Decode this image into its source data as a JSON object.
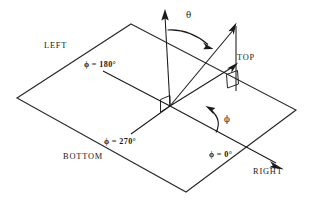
{
  "figure": {
    "type": "spherical-coordinate-diagram",
    "background_color": "#ffffff",
    "line_color": "#1a1a1a",
    "labels": {
      "theta": "θ",
      "phi": "ϕ",
      "top": "TOP",
      "left": "LEFT",
      "right": "RIGHT",
      "bottom": "BOTTOM",
      "phi_180": "ϕ = 180°",
      "phi_270": "ϕ = 270°",
      "phi_0": "ϕ = 0°"
    },
    "label_parts": {
      "phi_symbol": "ϕ",
      "equals": " = ",
      "deg_180": "180",
      "deg_270": "270",
      "deg_0": "0",
      "degree_sign": "°"
    },
    "geometry": {
      "plane_corners": [
        [
          131,
          24
        ],
        [
          296,
          110
        ],
        [
          186,
          192
        ],
        [
          17,
          98
        ]
      ],
      "origin": [
        170,
        106
      ],
      "zenith_arrow_tip": [
        165,
        10
      ],
      "vector_arrow_tip": [
        233,
        27
      ],
      "projection_arrow_tip": [
        232,
        65
      ],
      "right_arrow_tip": [
        281,
        168
      ]
    },
    "annotations": {
      "right_angle_origin": "right-angle-marker-at-origin",
      "right_angle_vector": "right-angle-marker-on-vector-drop"
    }
  }
}
